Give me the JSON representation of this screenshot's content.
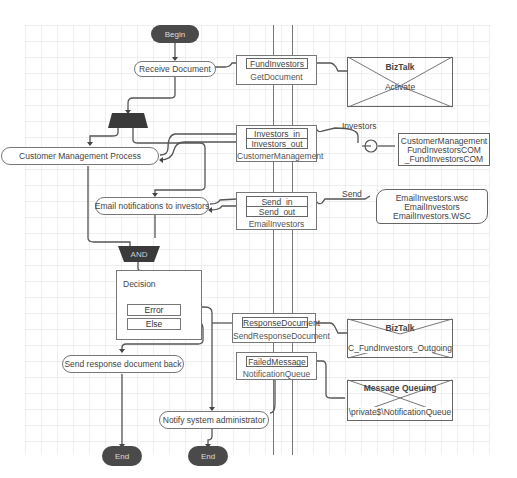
{
  "diagram": {
    "type": "orchestration-flow",
    "start": {
      "label": "Begin"
    },
    "actions": {
      "receive": "Receive Document",
      "customer_mgmt": "Customer Management Process",
      "email": "Email notifications to investors",
      "send_response": "Send response document back",
      "notify_admin": "Notify system administrator"
    },
    "join": {
      "label": "AND"
    },
    "decision": {
      "title": "Decision",
      "branches": [
        "Error",
        "Else"
      ]
    },
    "ends": [
      "End",
      "End"
    ],
    "ports": [
      {
        "messages": [
          "FundInvestors"
        ],
        "name": "GetDocument"
      },
      {
        "messages": [
          "Investors_in",
          "Investors_out"
        ],
        "name": "CustomerManagement"
      },
      {
        "messages": [
          "Send_in",
          "Send_out"
        ],
        "name": "EmailInvestors"
      },
      {
        "messages": [
          "ResponseDocument"
        ],
        "name": "SendResponseDocument"
      },
      {
        "messages": [
          "FailedMessage"
        ],
        "name": "NotificationQueue"
      }
    ],
    "connector_labels": {
      "investors": "Investors",
      "send": "Send"
    },
    "implementations": [
      {
        "kind": "BizTalk",
        "text": "Activate"
      },
      {
        "kind": "COM",
        "lines": [
          "CustomerManagement",
          "FundInvestorsCOM",
          "_FundInvestorsCOM"
        ]
      },
      {
        "kind": "WebService",
        "lines": [
          "EmailInvestors.wsc",
          "EmailInvestors",
          "EmailInvestors.WSC"
        ]
      },
      {
        "kind": "BizTalk",
        "text": "C_FundInvestors_Outgoing"
      },
      {
        "kind": "Message Queuing",
        "text": "\\private$\\NotificationQueue"
      }
    ]
  },
  "colors": {
    "terminal": "#4a4a4a",
    "line": "#666666",
    "grid": "#eeeeee"
  }
}
